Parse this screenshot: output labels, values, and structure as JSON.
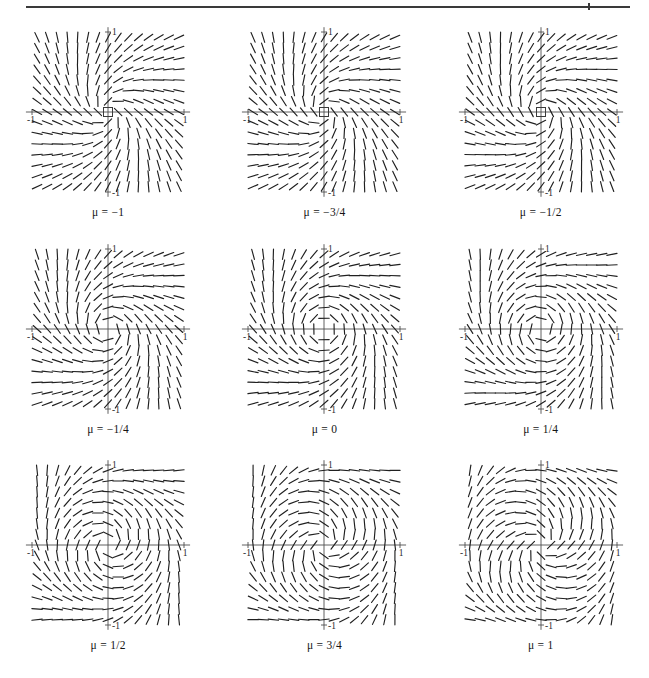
{
  "figure": {
    "kind": "direction-field-grid",
    "rows": 3,
    "columns": 3,
    "rule_visible": true
  },
  "axis": {
    "x_tick_neg": "-1",
    "x_tick_pos": "1",
    "y_tick_pos": "1",
    "y_tick_neg": "-1",
    "xlim": [
      -1,
      1
    ],
    "ylim": [
      -1,
      1
    ]
  },
  "colors": {
    "ink": "#202020",
    "axis": "#4e4e4e",
    "rule": "#3a3a3a",
    "paper": "#ffffff"
  },
  "chart_data": {
    "type": "scatter",
    "title": "",
    "xlabel": "",
    "ylabel": "",
    "xlim": [
      -1,
      1
    ],
    "ylim": [
      -1,
      1
    ],
    "grid": false,
    "legend": "none",
    "series": [
      {
        "name": "mu = -1",
        "mu": -1,
        "caption": "μ = −1",
        "origin_marker": "square",
        "behavior": "stable spiral / focus at origin"
      },
      {
        "name": "mu = -3/4",
        "mu": -0.75,
        "caption": "μ = −3/4",
        "origin_marker": "square",
        "behavior": "stable spiral / focus at origin"
      },
      {
        "name": "mu = -1/2",
        "mu": -0.5,
        "caption": "μ = −1/2",
        "origin_marker": "square",
        "behavior": "stable spiral / focus at origin"
      },
      {
        "name": "mu = -1/4",
        "mu": -0.25,
        "caption": "μ = −1/4",
        "origin_marker": "none",
        "behavior": "weakly stable spiral"
      },
      {
        "name": "mu = 0",
        "mu": 0,
        "caption": "μ = 0",
        "origin_marker": "none",
        "behavior": "bifurcation point, center-like spiral"
      },
      {
        "name": "mu = 1/4",
        "mu": 0.25,
        "caption": "μ = 1/4",
        "origin_marker": "none",
        "behavior": "unstable focus, small limit cycle"
      },
      {
        "name": "mu = 1/2",
        "mu": 0.5,
        "caption": "μ = 1/2",
        "origin_marker": "none",
        "behavior": "unstable focus, limit cycle"
      },
      {
        "name": "mu = 3/4",
        "mu": 0.75,
        "caption": "μ = 3/4",
        "origin_marker": "none",
        "behavior": "unstable focus, larger limit cycle"
      },
      {
        "name": "mu = 1",
        "mu": 1,
        "caption": "μ = 1",
        "origin_marker": "none",
        "behavior": "unstable focus, largest limit cycle"
      }
    ]
  },
  "panels": [
    {
      "id": "panel-mu-neg1",
      "caption": "μ = −1",
      "mu": -1,
      "origin_marker": "square"
    },
    {
      "id": "panel-mu-neg3-4",
      "caption": "μ = −3/4",
      "mu": -0.75,
      "origin_marker": "square"
    },
    {
      "id": "panel-mu-neg1-2",
      "caption": "μ = −1/2",
      "mu": -0.5,
      "origin_marker": "square"
    },
    {
      "id": "panel-mu-neg1-4",
      "caption": "μ = −1/4",
      "mu": -0.25,
      "origin_marker": "none"
    },
    {
      "id": "panel-mu-0",
      "caption": "μ = 0",
      "mu": 0,
      "origin_marker": "none"
    },
    {
      "id": "panel-mu-pos1-4",
      "caption": "μ = 1/4",
      "mu": 0.25,
      "origin_marker": "none"
    },
    {
      "id": "panel-mu-pos1-2",
      "caption": "μ = 1/2",
      "mu": 0.5,
      "origin_marker": "none"
    },
    {
      "id": "panel-mu-pos3-4",
      "caption": "μ = 3/4",
      "mu": 0.75,
      "origin_marker": "none"
    },
    {
      "id": "panel-mu-pos1",
      "caption": "μ = 1",
      "mu": 1,
      "origin_marker": "none"
    }
  ]
}
